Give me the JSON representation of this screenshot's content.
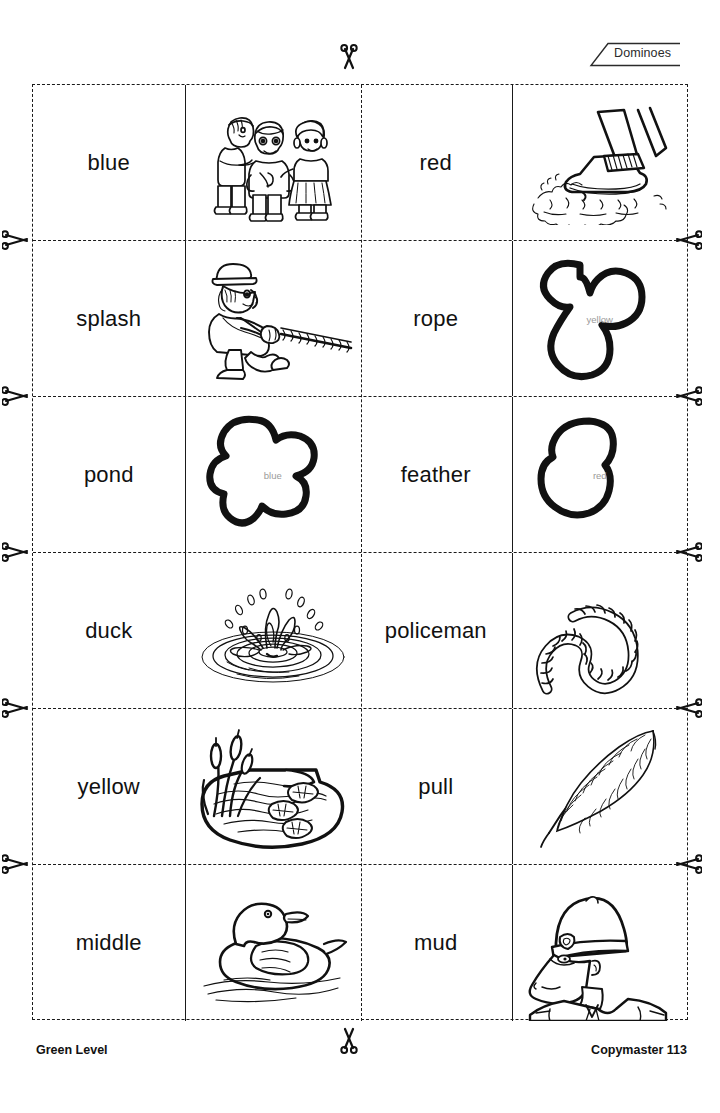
{
  "header": {
    "tag_label": "Dominoes",
    "tag_icon": "tag-banner-icon"
  },
  "footer": {
    "level_label": "Green Level",
    "copymaster_label": "Copymaster 113",
    "scissors_icon": "scissors-icon"
  },
  "worksheet": {
    "type": "domino-cut-out-grid",
    "rows": 6,
    "columns": 4,
    "column_kinds": [
      "word",
      "picture",
      "word",
      "picture"
    ]
  },
  "rows": [
    {
      "word_left": "blue",
      "picture_left": {
        "name": "three-children-illustration",
        "blob_label": ""
      },
      "word_right": "red",
      "picture_right": {
        "name": "boot-splashing-in-mud-illustration",
        "blob_label": ""
      }
    },
    {
      "word_left": "splash",
      "picture_left": {
        "name": "man-pulling-rope-illustration",
        "blob_label": ""
      },
      "word_right": "rope",
      "picture_right": {
        "name": "blob-shape-illustration",
        "blob_label": "yellow"
      }
    },
    {
      "word_left": "pond",
      "picture_left": {
        "name": "blob-shape-illustration",
        "blob_label": "blue"
      },
      "word_right": "feather",
      "picture_right": {
        "name": "blob-shape-illustration",
        "blob_label": "red"
      }
    },
    {
      "word_left": "duck",
      "picture_left": {
        "name": "water-splash-with-ripples-illustration",
        "blob_label": ""
      },
      "word_right": "policeman",
      "picture_right": {
        "name": "coiled-rope-illustration",
        "blob_label": ""
      }
    },
    {
      "word_left": "yellow",
      "picture_left": {
        "name": "pond-with-reeds-illustration",
        "blob_label": ""
      },
      "word_right": "pull",
      "picture_right": {
        "name": "feather-illustration",
        "blob_label": ""
      }
    },
    {
      "word_left": "middle",
      "picture_left": {
        "name": "duck-swimming-illustration",
        "blob_label": ""
      },
      "word_right": "mud",
      "picture_right": {
        "name": "policeman-portrait-illustration",
        "blob_label": ""
      }
    }
  ],
  "cut_marks": {
    "top_scissors_count": 1,
    "bottom_scissors_count": 1,
    "left_scissors_count": 5,
    "right_scissors_count": 5
  },
  "colors": {
    "ink": "#111111",
    "line": "#1a1a1a",
    "blob_label": "#9a9a9a",
    "background": "#ffffff"
  }
}
